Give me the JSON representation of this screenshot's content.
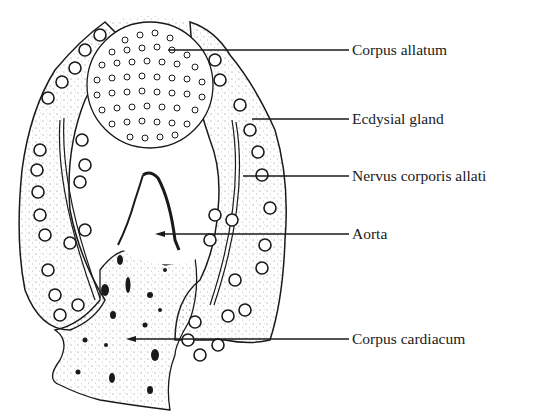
{
  "figure": {
    "type": "anatomical line drawing",
    "colors": {
      "ink": "#1a1a1a",
      "background": "#ffffff",
      "stipple": "#555555"
    }
  },
  "labels": [
    {
      "id": "corpus-allatum",
      "text": "Corpus allatum",
      "x": 352,
      "y": 50,
      "line_from_x": 168
    },
    {
      "id": "ecdysial-gland",
      "text": "Ecdysial gland",
      "x": 352,
      "y": 119,
      "line_from_x": 252
    },
    {
      "id": "nervus-corporis-allati",
      "text": "Nervus corporis allati",
      "x": 352,
      "y": 176,
      "line_from_x": 243
    },
    {
      "id": "aorta",
      "text": "Aorta",
      "x": 352,
      "y": 234,
      "line_from_x": 158
    },
    {
      "id": "corpus-cardiacum",
      "text": "Corpus cardiacum",
      "x": 352,
      "y": 339,
      "line_from_x": 128
    }
  ]
}
